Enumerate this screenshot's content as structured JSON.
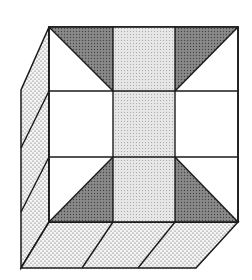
{
  "figure": {
    "colors": {
      "background": "#ffffff",
      "stroke": "#1a1a1a",
      "dark_shade": "#7a7a7a",
      "light_shade": "#e2e2e2",
      "dot_face": "#f2f2f2",
      "dot": "#555555"
    },
    "front_face": {
      "x0": 49,
      "y0": 27,
      "x1": 238,
      "y1": 222,
      "col_lines": [
        113,
        175
      ],
      "row_lines": [
        91,
        157
      ]
    },
    "left_face": {
      "back_x": 21,
      "top_y": 90,
      "bottom_y": 268,
      "dividers": [
        [
          49,
          91,
          21,
          148
        ],
        [
          49,
          157,
          21,
          212
        ]
      ]
    },
    "bottom_face": {
      "bottom_y": 268,
      "left_x": 21,
      "right_x": 196,
      "dividers": [
        [
          113,
          222,
          82,
          268
        ],
        [
          175,
          222,
          138,
          268
        ]
      ]
    }
  }
}
